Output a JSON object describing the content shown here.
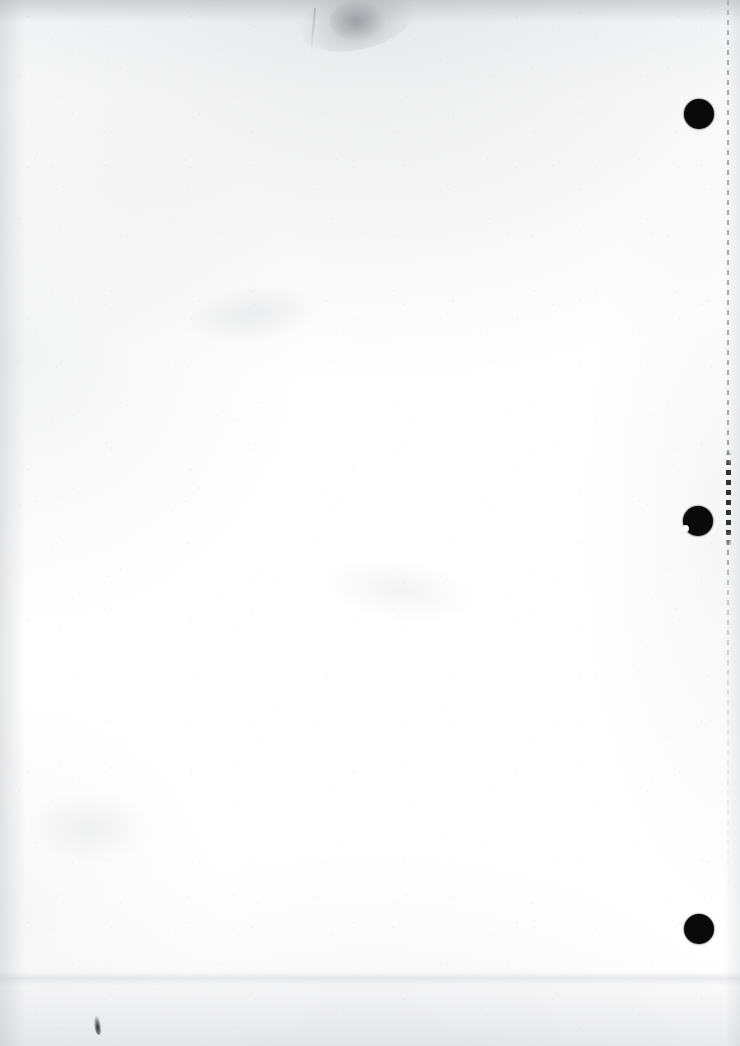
{
  "document": {
    "kind": "scanned-page",
    "orientation": "portrait",
    "page_width_px": 740,
    "page_height_px": 1046,
    "content_text": "",
    "visible_text_count": 0,
    "description": "Blank scanned sheet — no printed or handwritten text visible"
  },
  "colors": {
    "paper": "#fefefe",
    "paper_shadow": "#a8abb0",
    "punch_hole": "#0a0a0a",
    "perforation_light": "#969ba0",
    "perforation_dark": "#232428",
    "ink_speck": "#141416"
  },
  "marks": {
    "punch_holes": [
      {
        "name": "punch-hole-top",
        "center_x": 699,
        "center_y": 114,
        "diameter": 30
      },
      {
        "name": "punch-hole-middle",
        "center_x": 698,
        "center_y": 521,
        "diameter": 30,
        "notched": true
      },
      {
        "name": "punch-hole-bottom",
        "center_x": 699,
        "center_y": 929,
        "diameter": 30
      }
    ],
    "perforation_line": {
      "name": "perforation-guide-line",
      "x": 727,
      "top": 0,
      "bottom": 1046,
      "dash_length": 5,
      "gap_length": 5,
      "emphasis_top": 450,
      "emphasis_bottom": 548
    },
    "smudges": [
      {
        "name": "smudge-top-gray",
        "x": 296,
        "y": 0,
        "width": 120,
        "height": 64
      },
      {
        "name": "smudge-top-streak",
        "x": 312,
        "y": 8,
        "width": 2,
        "height": 46
      },
      {
        "name": "smudge-mid-left",
        "x": 188,
        "y": 286,
        "width": 130,
        "height": 56
      },
      {
        "name": "smudge-mid-center",
        "x": 324,
        "y": 560,
        "width": 150,
        "height": 60
      },
      {
        "name": "smudge-lower-left",
        "x": 30,
        "y": 792,
        "width": 120,
        "height": 70
      },
      {
        "name": "ink-speck-bottom",
        "x": 94,
        "y": 1016,
        "width": 7,
        "height": 19
      }
    ],
    "edge_shading": [
      {
        "name": "edge-shade-top",
        "side": "top",
        "thickness": 22
      },
      {
        "name": "edge-shade-left",
        "side": "left",
        "thickness": 26
      },
      {
        "name": "edge-shade-right",
        "side": "right",
        "thickness": 16
      },
      {
        "name": "edge-shade-bottom",
        "side": "bottom",
        "thickness": 74
      },
      {
        "name": "scan-band-bottom",
        "side": "bottom",
        "y": 972,
        "thickness": 14
      }
    ]
  }
}
